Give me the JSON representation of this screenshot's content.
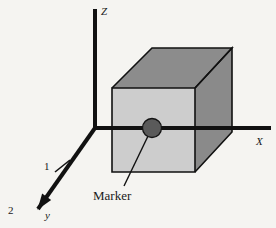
{
  "figure": {
    "background_color": "#f5f4f1",
    "stroke_color": "#111111",
    "canvas": {
      "width": 276,
      "height": 228
    }
  },
  "axes": {
    "origin": {
      "x": 95,
      "y": 128
    },
    "z_axis": {
      "name": "Z axis",
      "label": "Z",
      "label_pos": {
        "x": 101,
        "y": 15
      },
      "from": {
        "x": 95,
        "y": 128
      },
      "to": {
        "x": 95,
        "y": 9
      },
      "width": 4
    },
    "x_axis": {
      "name": "X axis",
      "label": "X",
      "label_pos": {
        "x": 256,
        "y": 145
      },
      "from": {
        "x": 95,
        "y": 128
      },
      "to": {
        "x": 271,
        "y": 128
      },
      "width": 4
    },
    "y_axis": {
      "name": "Y axis",
      "label": "y",
      "label_pos": {
        "x": 45,
        "y": 219
      },
      "from": {
        "x": 95,
        "y": 128
      },
      "to": {
        "x": 38,
        "y": 209
      },
      "width": 4,
      "arrowhead": true
    },
    "ticks": [
      {
        "label": "1",
        "label_pos": {
          "x": 44,
          "y": 170
        },
        "mark_from": {
          "x": 55,
          "y": 172
        },
        "mark_to": {
          "x": 70,
          "y": 160
        }
      },
      {
        "label": "2",
        "label_pos": {
          "x": 8,
          "y": 214
        },
        "mark_from": null,
        "mark_to": null
      }
    ]
  },
  "box": {
    "name": "3D box",
    "front_face": {
      "color": "#cdcdcd",
      "points": "112,88 195,88 195,172 112,172"
    },
    "top_face": {
      "color": "#8c8c8c",
      "points": "112,88 152,48 232,48 195,88"
    },
    "right_face": {
      "color": "#8a8a8a",
      "points": "195,88 232,48 232,132 195,172"
    },
    "edge_color": "#111111",
    "edge_width": 1.6
  },
  "marker": {
    "name": "Marker",
    "label": "Marker",
    "label_pos": {
      "x": 93,
      "y": 200
    },
    "dot": {
      "cx": 152,
      "cy": 128,
      "r": 9.5,
      "color": "#5a5a5a",
      "edge": "#141414"
    },
    "leader_from": {
      "x": 149,
      "y": 134
    },
    "leader_to": {
      "x": 124,
      "y": 186
    },
    "leader_width": 1.4
  }
}
